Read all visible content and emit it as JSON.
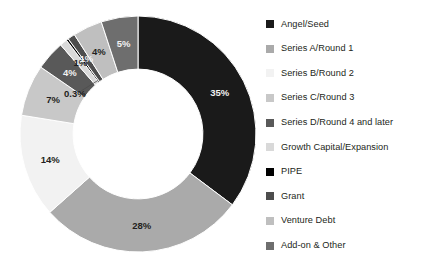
{
  "chart_data": {
    "type": "pie",
    "variant": "donut",
    "title": "",
    "subtitle": "",
    "xlabel": "",
    "ylabel": "",
    "grid": false,
    "legend_position": "right",
    "start_angle_deg": 0,
    "direction": "clockwise",
    "inner_radius_ratio": 0.55,
    "categories": [
      "Angel/Seed",
      "Series A/Round 1",
      "Series B/Round 2",
      "Series C/Round 3",
      "Series D/Round 4 and later",
      "Growth Capital/Expansion",
      "PIPE",
      "Grant",
      "Venture Debt",
      "Add-on & Other"
    ],
    "values": [
      35,
      28,
      14,
      7,
      4,
      1,
      0.3,
      1,
      4,
      5
    ],
    "value_labels": [
      "35%",
      "28%",
      "14%",
      "7%",
      "4%",
      "1%",
      "0.3%",
      "1%",
      "4%",
      "5%"
    ],
    "colors": [
      "#1a1a1a",
      "#aaaaaa",
      "#f2f2f2",
      "#c8c8c8",
      "#595959",
      "#d9d9d9",
      "#000000",
      "#4d4d4d",
      "#bfbfbf",
      "#6e6e6e"
    ],
    "label_text_colors": [
      "light",
      "dark",
      "dark",
      "dark",
      "light",
      "dark",
      "dark",
      "light",
      "dark",
      "light"
    ],
    "callout_labels": [
      "PIPE"
    ],
    "units": "percent"
  },
  "legend": {
    "items": [
      {
        "label": "Angel/Seed",
        "color": "#1a1a1a"
      },
      {
        "label": "Series A/Round 1",
        "color": "#aaaaaa"
      },
      {
        "label": "Series B/Round 2",
        "color": "#f2f2f2"
      },
      {
        "label": "Series C/Round 3",
        "color": "#c8c8c8"
      },
      {
        "label": "Series D/Round 4 and later",
        "color": "#595959"
      },
      {
        "label": "Growth Capital/Expansion",
        "color": "#d9d9d9"
      },
      {
        "label": "PIPE",
        "color": "#000000"
      },
      {
        "label": "Grant",
        "color": "#4d4d4d"
      },
      {
        "label": "Venture Debt",
        "color": "#bfbfbf"
      },
      {
        "label": "Add-on & Other",
        "color": "#6e6e6e"
      }
    ]
  }
}
